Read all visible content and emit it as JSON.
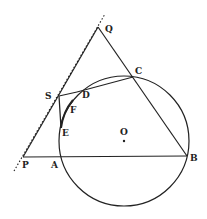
{
  "diagram": {
    "type": "geometry",
    "circle": {
      "center_label": "O"
    },
    "points": {
      "Q": "Q",
      "C": "C",
      "S": "S",
      "D": "D",
      "F": "F",
      "E": "E",
      "P": "P",
      "A": "A",
      "B": "B",
      "O": "O"
    },
    "segments": [
      "QB",
      "QP",
      "PB",
      "SD",
      "DC",
      "SE"
    ],
    "tangent_line": "dotted line through P"
  }
}
